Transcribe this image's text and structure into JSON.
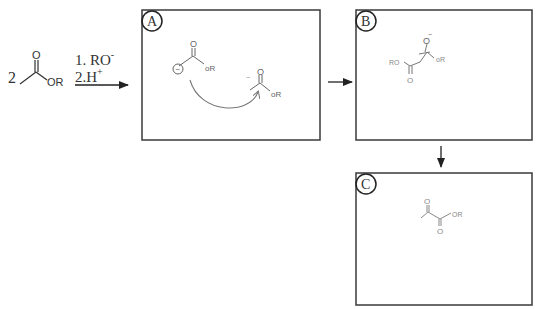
{
  "reaction": {
    "coefficient": "2",
    "reactant": {
      "carbonyl_oxygen": "O",
      "ester_group": "OR"
    },
    "conditions": {
      "step1": "1. RO",
      "step1_superscript": "-",
      "step2": "2.H",
      "step2_superscript": "+"
    }
  },
  "panels": [
    {
      "label": "A",
      "enolate": {
        "carbonyl_o": "O",
        "charge": "−",
        "group": "oR"
      },
      "ester": {
        "carbonyl_o": "O",
        "charge": "−",
        "group": "oR"
      }
    },
    {
      "label": "B",
      "alkoxide_o": "O",
      "alkoxide_charge": "−",
      "left_group": "RO",
      "right_group": "oR",
      "lower_o": "O"
    },
    {
      "label": "C",
      "ketone_o": "O",
      "ester_o": "O",
      "group": "OR"
    }
  ],
  "colors": {
    "print_ink": "#333333",
    "box_border": "#3a3a3a",
    "handwriting": "#6a6a6a"
  }
}
